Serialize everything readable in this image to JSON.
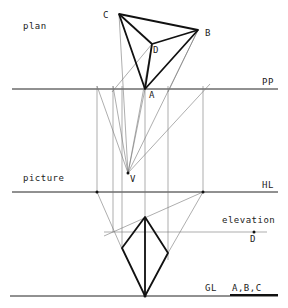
{
  "labels": {
    "plan": "plan",
    "picture": "picture",
    "elevation": "elevation",
    "pp": "PP",
    "hl": "HL",
    "gl": "GL",
    "abc": "A,B,C",
    "a": "A",
    "b": "B",
    "c": "C",
    "d": "D",
    "v": "V",
    "d_elev": "D"
  },
  "colors": {
    "ink": "#111111",
    "construction": "#777777",
    "background": "#ffffff"
  },
  "points": {
    "A": [
      145,
      89
    ],
    "B": [
      198,
      30
    ],
    "C": [
      119,
      14
    ],
    "D": [
      152,
      44
    ],
    "V": [
      128,
      173
    ]
  }
}
